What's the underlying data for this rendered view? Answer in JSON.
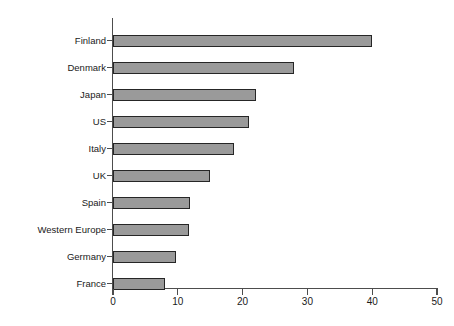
{
  "chart_data": {
    "type": "bar",
    "orientation": "horizontal",
    "title": "",
    "subtitle": "",
    "xlabel": "",
    "ylabel": "",
    "categories": [
      "Finland",
      "Denmark",
      "Japan",
      "US",
      "Italy",
      "UK",
      "Spain",
      "Western Europe",
      "Germany",
      "France"
    ],
    "values": [
      40,
      28,
      22,
      21,
      18.7,
      15,
      11.9,
      11.7,
      9.7,
      8
    ],
    "xlim": [
      0,
      50
    ],
    "xticks": [
      0,
      10,
      20,
      30,
      40,
      50
    ],
    "xtick_labels": [
      "0",
      "10",
      "20",
      "30",
      "40",
      "50"
    ],
    "grid": false,
    "legend": false,
    "legend_position": "none",
    "bar_fill_color": "#9a9a9a",
    "bar_edge_color": "#262626",
    "axis_color": "#4d4d4d",
    "background_color": "#ffffff"
  }
}
